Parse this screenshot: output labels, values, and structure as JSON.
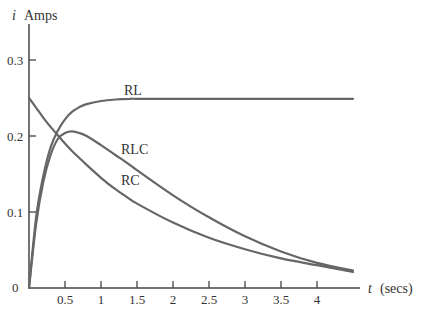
{
  "chart_data": {
    "type": "line",
    "title": "",
    "xlabel": "t (secs)",
    "ylabel": "i Amps",
    "xlabel_var": "t",
    "xlabel_unit": "(secs)",
    "ylabel_var": "i",
    "ylabel_unit": "Amps",
    "xlim": [
      0,
      4.75
    ],
    "ylim": [
      0,
      0.35
    ],
    "grid": false,
    "legend": "inline labels on curves",
    "x_ticks": [
      0.5,
      1,
      1.5,
      2,
      2.5,
      3,
      3.5,
      4
    ],
    "x_tick_labels": [
      "0.5",
      "1",
      "1.5",
      "2",
      "2.5",
      "3",
      "3.5",
      "4"
    ],
    "y_ticks": [
      0,
      0.1,
      0.2,
      0.3
    ],
    "y_tick_labels": [
      "0",
      "0.1",
      "0.2",
      "0.3"
    ],
    "x": [
      0,
      0.1,
      0.2,
      0.3,
      0.4,
      0.5,
      0.6,
      0.7,
      0.8,
      1.0,
      1.2,
      1.4,
      1.5,
      2.0,
      2.5,
      3.0,
      3.5,
      4.0,
      4.5
    ],
    "series": [
      {
        "name": "RL",
        "label": "RL",
        "values": [
          0,
          0.094,
          0.148,
          0.185,
          0.207,
          0.222,
          0.232,
          0.238,
          0.242,
          0.246,
          0.248,
          0.249,
          0.249,
          0.249,
          0.249,
          0.249,
          0.249,
          0.249,
          0.249
        ]
      },
      {
        "name": "RLC",
        "label": "RLC",
        "values": [
          0,
          0.085,
          0.14,
          0.175,
          0.196,
          0.204,
          0.206,
          0.204,
          0.2,
          0.188,
          0.175,
          0.162,
          0.155,
          0.122,
          0.093,
          0.068,
          0.048,
          0.033,
          0.023
        ]
      },
      {
        "name": "RC",
        "label": "RC",
        "values": [
          0.25,
          0.237,
          0.224,
          0.212,
          0.201,
          0.19,
          0.18,
          0.171,
          0.162,
          0.145,
          0.13,
          0.117,
          0.111,
          0.086,
          0.066,
          0.051,
          0.039,
          0.03,
          0.021
        ]
      }
    ],
    "annotations": [
      {
        "text": "RL",
        "x": 1.5,
        "y": 0.265
      },
      {
        "text": "RLC",
        "x": 1.45,
        "y": 0.16
      },
      {
        "text": "RC",
        "x": 1.4,
        "y": 0.12
      }
    ]
  },
  "labels": {
    "y_var": "i",
    "y_unit": "Amps",
    "x_var": "t",
    "x_unit": "(secs)",
    "origin": "0",
    "curve_rl": "RL",
    "curve_rlc": "RLC",
    "curve_rc": "RC"
  }
}
